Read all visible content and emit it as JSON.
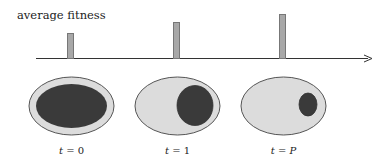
{
  "diagram": {
    "ylabel": "average fitness",
    "colors": {
      "bar_fill": "#a8a8a8",
      "bar_stroke": "#777777",
      "axis": "#333333",
      "outer_fill": "#dcdcdc",
      "outer_stroke": "#555555",
      "inner_fill": "#3a3a3a"
    },
    "bars": [
      {
        "x": 67,
        "top": 33
      },
      {
        "x": 173,
        "top": 22
      },
      {
        "x": 279,
        "top": 14
      }
    ],
    "populations": [
      {
        "label_var": "t",
        "label_eq": " = ",
        "label_val": "0",
        "cx": 71.5,
        "inner": {
          "cx": 71.5,
          "cy": 106,
          "rx": 35.5,
          "ry": 22
        }
      },
      {
        "label_var": "t",
        "label_eq": " = ",
        "label_val": "1",
        "cx": 177.5,
        "inner": {
          "cx": 195,
          "cy": 105.5,
          "rx": 18,
          "ry": 20
        }
      },
      {
        "label_var": "t",
        "label_eq": " = ",
        "label_val": "P",
        "cx": 283.5,
        "inner": {
          "cx": 308,
          "cy": 104.5,
          "rx": 9,
          "ry": 11.5
        }
      }
    ]
  }
}
